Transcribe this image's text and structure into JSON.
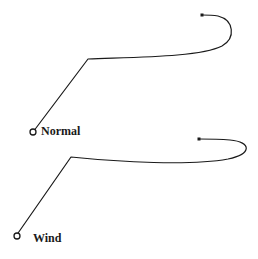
{
  "diagram": {
    "type": "trajectory-comparison",
    "stroke_color": "#1a1a1a",
    "background": "#ffffff",
    "trajectories": [
      {
        "label": "Normal",
        "start": [
          33,
          132
        ],
        "corner": [
          88,
          59
        ],
        "end": [
          202,
          15
        ],
        "path": "M33,132 L88,59 C140,57 200,57 222,46 C236,38 234,20 218,16 C212,15 207,15 202,15"
      },
      {
        "label": "Wind",
        "start": [
          16,
          236
        ],
        "corner": [
          71,
          157
        ],
        "end": [
          199,
          139
        ],
        "path": "M16,236 L71,157 C120,162 190,166 228,159 C252,154 252,142 230,140 C218,139 208,139 199,139"
      }
    ]
  }
}
